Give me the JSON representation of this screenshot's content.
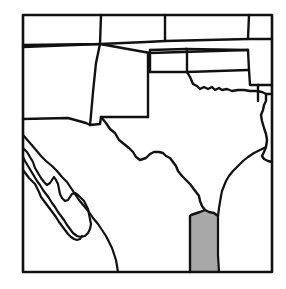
{
  "figure": {
    "type": "line-art-map",
    "title": "",
    "caption": "",
    "width": 286,
    "height": 289,
    "background_color": "#ffffff"
  },
  "style": {
    "frame_color": "#111111",
    "frame_width": 2.6,
    "border_color": "#111111",
    "border_width": 2.4,
    "coast_width": 2.2,
    "highlight_fill": "#a8a8a8",
    "map_fill": "#ffffff"
  },
  "frame": {
    "x": 23,
    "y": 15,
    "width": 249,
    "height": 257
  },
  "chart_data": {
    "type": "map",
    "title": "",
    "legend": [],
    "highlighted_regions": [
      {
        "name": "lower-rio-grande-valley",
        "fill": "#a8a8a8",
        "label": ""
      }
    ],
    "features": [
      {
        "name": "map-frame",
        "kind": "frame"
      },
      {
        "name": "utah-colorado-northern-line",
        "kind": "state-border"
      },
      {
        "name": "arizona-new-mexico-border",
        "kind": "state-border"
      },
      {
        "name": "new-mexico-colorado-border",
        "kind": "state-border"
      },
      {
        "name": "colorado-kansas-border",
        "kind": "state-border"
      },
      {
        "name": "oklahoma-panhandle",
        "kind": "state-border"
      },
      {
        "name": "kansas-oklahoma-border",
        "kind": "state-border"
      },
      {
        "name": "missouri-arkansas-corner",
        "kind": "state-border"
      },
      {
        "name": "red-river-texas-oklahoma",
        "kind": "river-border"
      },
      {
        "name": "texas-louisiana-border",
        "kind": "state-border"
      },
      {
        "name": "texas-gulf-coast",
        "kind": "coastline"
      },
      {
        "name": "rio-grande-texas-mexico",
        "kind": "river-border"
      },
      {
        "name": "mexico-usa-border-west",
        "kind": "international-border"
      },
      {
        "name": "gulf-of-california",
        "kind": "coastline"
      },
      {
        "name": "baja-california-peninsula",
        "kind": "coastline"
      }
    ]
  },
  "paths": {
    "frame": "M23,15 L272,15 L272,272 L23,272 Z",
    "utah_colorado_north_line": "M23,45 L100,44 L146,42 L165,41 L248,39 L272,39",
    "upper_tier_div_a": "M101,15 L100,44",
    "upper_tier_div_b": "M165,15 L165,41",
    "upper_tier_div_c": "M249,15 L248,39",
    "co_nm_line": "M23,47 L100,44 L150,53 L248,50",
    "az_nm_vertical": "M100,44 L96,63 L93,92 L91,115 L90,125",
    "nm_south_line": "M23,119 L68,118 L86,123 L90,125 L100,124 L101,117 L122,117 L148,117",
    "nm_east_vertical": "M148,53 L148,117",
    "tx_panhandle_west": "M148,53 L150,53",
    "ok_panhandle_top": "M150,50 L186,49",
    "ok_panhandle_left": "M150,50 L150,72",
    "ok_panhandle_bottom": "M150,72 L187,72",
    "ok_panhandle_right": "M187,49 L187,72",
    "co_ks_right": "M186,49 L248,50",
    "ks_ok_border": "M187,72 L248,70",
    "mo_ar_corner": "M248,50 L249,70 L250,85 L272,85",
    "ar_vertical": "M258,85 L258,101",
    "red_river": "M187,72 L190,77 L193,84 L197,86 L200,89 L204,87 L208,89 L212,87 L215,90 L219,88 L222,90 L227,89 L232,91 L238,90 L244,90 L250,91 L256,91 L262,92 L266,94 L272,94",
    "tx_la_border": "M266,94 L266,101 L264,105 L263,110 L261,115 L262,121 L264,128 L266,134 L267,140 L266,147 L264,152 L262,156 L264,159 L268,161 L272,162",
    "tx_gulf_coast": "M266,147 L260,150 L254,153 L248,157 L243,161 L238,166 L233,171 L229,176 L226,181 L224,186 L222,191 L221,196 L220,202 L219,208 L218,216 L218,226 L218,240 L218,255 L219,272",
    "rio_grande": "M101,117 L106,123 L110,129 L115,133 L119,140 L124,144 L129,148 L133,152 L136,157 L140,160 L146,158 L150,154 L154,152 L159,152 L163,153 L166,156 L170,158 L173,162 L176,166 L178,171 L182,176 L186,180 L190,184 L193,188 L196,192 L199,196 L200,201 L202,206 L205,210 L209,212 L214,213 L218,216",
    "rio_grande_delta": "M205,210 L200,212 L197,213 L194,214 L191,215 L190,216 L190,272",
    "highlight_polygon": "M205,210 L209,212 L214,213 L218,216 L218,226 L218,240 L218,255 L219,272 L190,272 L190,216 L191,215 L194,214 L197,213 L200,212 Z",
    "mexico_border_west": "M23,135 L30,143 L36,150 L41,156 L46,161 L52,166 L57,171 L62,177 L67,182 L71,188 L75,194 L79,200 L84,206 L89,212 L93,218 L98,224 L102,230 L106,236 L109,242 L112,248 L114,254 L116,260 L117,266 L118,272",
    "gulf_of_california": "M23,148 L27,152 L30,157 L33,162 L35,168 L38,173 L41,178 L44,182 L47,185 L50,183 L52,180 L54,177 L56,180 L58,184 L59,189 L60,194 L62,198 L65,201 L68,200 L70,197 L72,194 L75,193 L78,195 L81,198 L84,201 L86,205 L88,209 L89,214 L90,219 L91,224 L90,229 L88,233 L85,236 L81,237 L77,236 L73,233 L70,229 L67,225 L64,220 L61,216 L58,212 L55,207 L52,203 L49,198 L46,194 L43,190 L40,185 L37,181 L34,176 L31,171 L28,166 L25,161 L23,157",
    "baja_inner": "M23,170 L26,174 L29,178 L32,181 L35,184 L37,188 L39,192 L41,197 L44,201 L47,205 L50,209 L53,213 L56,217 L59,222 L62,226 L65,230 L68,234 L71,237 L74,239 L77,240 L80,239 L82,236"
  }
}
